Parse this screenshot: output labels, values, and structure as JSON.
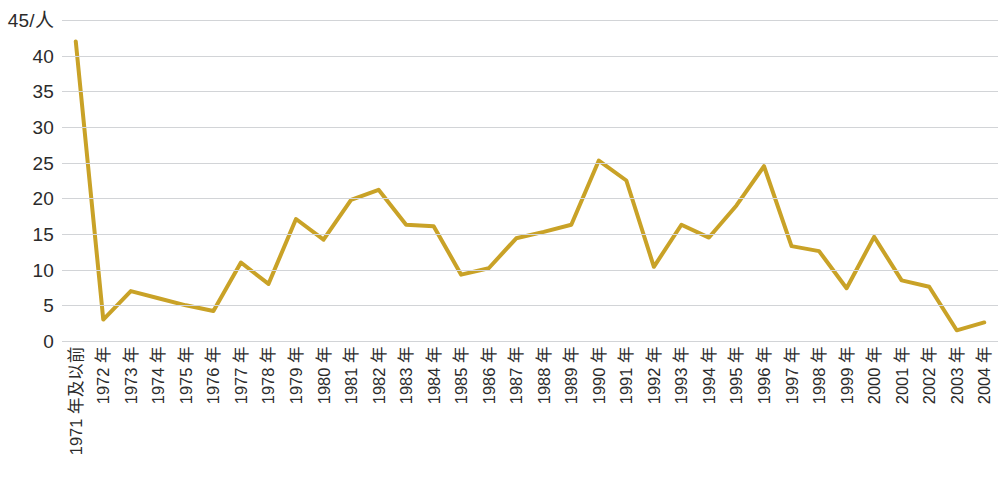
{
  "chart_data": {
    "type": "line",
    "title": "",
    "subtitle": "",
    "xlabel": "",
    "ylabel": "45/人",
    "ylim": [
      0,
      45
    ],
    "ytick_step": 5,
    "yticks": [
      45,
      40,
      35,
      30,
      25,
      20,
      15,
      10,
      5,
      0
    ],
    "ytick_labels": [
      "45/人",
      "40",
      "35",
      "30",
      "25",
      "20",
      "15",
      "10",
      "5",
      "0"
    ],
    "grid": true,
    "grid_axis": "y",
    "legend": false,
    "legend_position": "none",
    "line_color": "#C9A227",
    "line_width": 4,
    "markers": false,
    "categories": [
      "1971 年及以前",
      "1972 年",
      "1973 年",
      "1974 年",
      "1975 年",
      "1976 年",
      "1977 年",
      "1978 年",
      "1979 年",
      "1980 年",
      "1981 年",
      "1982 年",
      "1983 年",
      "1984 年",
      "1985 年",
      "1986 年",
      "1987 年",
      "1988 年",
      "1989 年",
      "1990 年",
      "1991 年",
      "1992 年",
      "1993 年",
      "1994 年",
      "1995 年",
      "1996 年",
      "1997 年",
      "1998 年",
      "1999 年",
      "2000 年",
      "2001 年",
      "2002 年",
      "2003 年",
      "2004 年"
    ],
    "values": [
      42.0,
      3.0,
      7.0,
      6.0,
      5.0,
      4.2,
      11.0,
      8.0,
      17.1,
      14.2,
      19.8,
      21.2,
      16.3,
      16.1,
      9.3,
      10.2,
      14.4,
      15.3,
      16.3,
      25.3,
      22.5,
      10.4,
      16.3,
      14.5,
      19.0,
      24.5,
      13.3,
      12.6,
      7.4,
      14.6,
      8.5,
      7.6,
      1.5,
      2.6
    ]
  }
}
